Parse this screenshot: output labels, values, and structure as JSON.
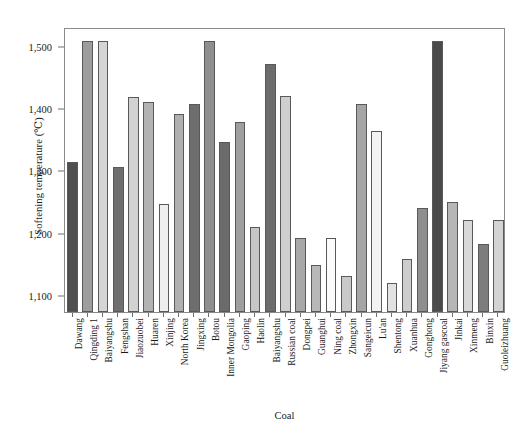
{
  "chart_data": {
    "type": "bar",
    "title": "",
    "xlabel": "Coal",
    "ylabel": "Softening temperature (℃)",
    "ylim": [
      1073,
      1530
    ],
    "ytick_values": [
      1100,
      1200,
      1300,
      1400,
      1500
    ],
    "ytick_labels": [
      "1,100",
      "1,200",
      "1,300",
      "1,400",
      "1,500"
    ],
    "grid": false,
    "legend": "none",
    "categories": [
      "Dawang",
      "Qingding 1",
      "Baiyangshu",
      "Fengshan",
      "Jiaozuobei",
      "Huaren",
      "Xinjing",
      "North Korea",
      "Jingxing",
      "Botou",
      "Inner Mongolia",
      "Gaoping",
      "Haolin",
      "Baiyangshu",
      "Russian coal",
      "Dongpei",
      "Guanghui",
      "Ning coal",
      "Zhongxin",
      "Sangeicun",
      "Lu'an",
      "Shentong",
      "Xuanhua",
      "Gonghong",
      "Jiyang gascoal",
      "Jinkai",
      "Xinmeng",
      "Binxin",
      "Guoleizhuang"
    ],
    "values": [
      1314,
      1508,
      1508,
      1306,
      1418,
      1410,
      1247,
      1391,
      1406,
      1508,
      1345,
      1377,
      1210,
      1471,
      1419,
      1192,
      1148,
      1192,
      1131,
      1406,
      1363,
      1119,
      1158,
      1239,
      1508,
      1249,
      1220,
      1182,
      1220
    ],
    "bar_colors": [
      "#4f4f4f",
      "#9d9d9d",
      "#d5d5d5",
      "#6f6f6f",
      "#d2d2d2",
      "#b3b3b3",
      "#eeeeee",
      "#b0b0b0",
      "#6e6e6e",
      "#8f8f8f",
      "#6b6b6b",
      "#9f9f9f",
      "#c6c6c6",
      "#6c6c6c",
      "#cfcfcf",
      "#a8a8a8",
      "#b8b8b8",
      "#fbfbfb",
      "#c9c9c9",
      "#a5a5a5",
      "#f3f3f3",
      "#e2e2e2",
      "#cdcdcd",
      "#8e8e8e",
      "#4a4a4a",
      "#b6b6b6",
      "#d8d8d8",
      "#7d7d7d",
      "#d3d3d3"
    ]
  }
}
